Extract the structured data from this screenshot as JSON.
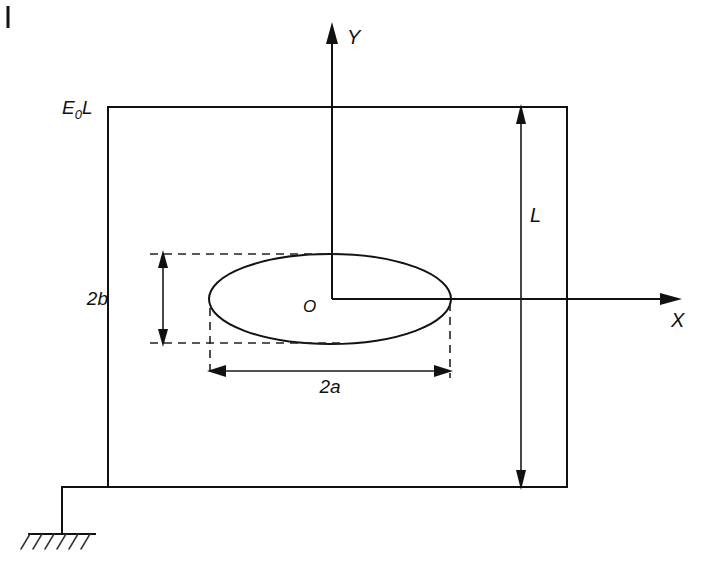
{
  "figure": {
    "background_color": "#ffffff",
    "line_color": "#111111",
    "labels": {
      "applied_strain": "E",
      "applied_strain_subscript": "0",
      "applied_strain_suffix": "L",
      "applied_strain_full": "E0L",
      "axis_y": "Y",
      "axis_x": "X",
      "origin": "O",
      "plate_height": "L",
      "minor_axis": "2b",
      "major_axis": "2a"
    },
    "geometry": {
      "plate": {
        "left": 108,
        "top": 107,
        "right": 567,
        "bottom": 487
      },
      "ellipse": {
        "cx": 330,
        "cy": 299,
        "rx": 121,
        "ry": 45
      },
      "y_axis": {
        "x": 332,
        "top": 25,
        "bottom": 299
      },
      "x_axis": {
        "y": 299,
        "left": 332,
        "right": 681
      },
      "dimension_L": {
        "x": 521,
        "top": 107,
        "bottom": 487
      },
      "dimension_2a": {
        "y": 371,
        "left": 210,
        "right": 450
      },
      "dimension_2b": {
        "x": 163,
        "top": 254,
        "bottom": 342
      },
      "ground": {
        "stem_x": 62,
        "stem_top": 487,
        "stem_bottom": 534,
        "line_left": 28,
        "line_right": 96,
        "hatch_count": 6
      },
      "corner_tick": {
        "x": 8,
        "y_top": 6,
        "y_bottom": 28
      }
    }
  }
}
